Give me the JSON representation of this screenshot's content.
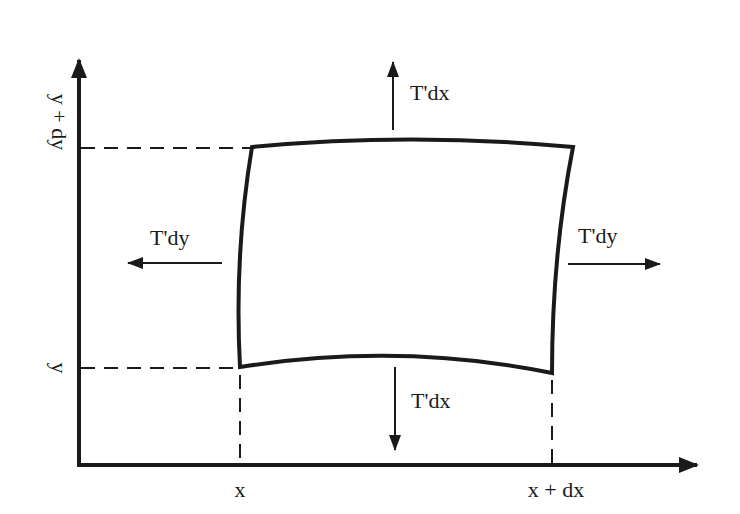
{
  "diagram": {
    "type": "string-element-tension-diagram",
    "colors": {
      "ink": "#1a1a1a",
      "background": "#ffffff"
    },
    "axes": {
      "x_axis": {
        "label": "",
        "ticks": [
          {
            "label": "x"
          },
          {
            "label": "x + dx"
          }
        ]
      },
      "y_axis": {
        "label": "",
        "ticks": [
          {
            "label": "y"
          },
          {
            "label": "y + dy"
          }
        ]
      }
    },
    "element": {
      "shape": "curved-quadrilateral"
    },
    "forces": {
      "top": {
        "label": "T'dx",
        "direction": "up"
      },
      "bottom": {
        "label": "T'dx",
        "direction": "down"
      },
      "left": {
        "label": "T'dy",
        "direction": "left"
      },
      "right": {
        "label": "T'dy",
        "direction": "right"
      }
    }
  }
}
